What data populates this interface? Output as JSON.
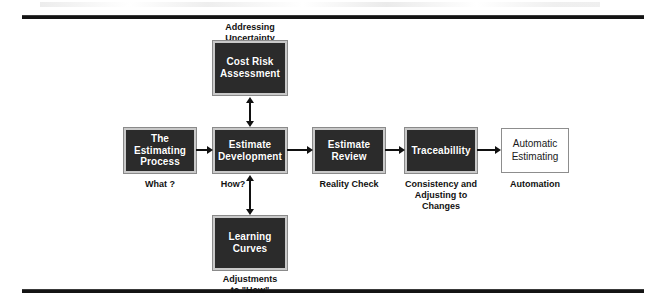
{
  "diagram": {
    "colors": {
      "node_fill_dark": "#2b2b2b",
      "node_border_light": "#c9c9c9",
      "node_fill_light": "#ffffff",
      "node_border_grey": "#8d8d8d",
      "text_on_dark": "#ffffff",
      "text_on_light": "#1a1a1a",
      "connector": "#111111",
      "rule": "#141414",
      "background": "#ffffff"
    },
    "nodes": [
      {
        "id": "estimating-process",
        "label": "The\nEstimating\nProcess",
        "style": "dark",
        "caption": "What ?"
      },
      {
        "id": "estimate-development",
        "label": "Estimate\nDevelopment",
        "style": "dark",
        "caption": "How?"
      },
      {
        "id": "estimate-review",
        "label": "Estimate\nReview",
        "style": "dark",
        "caption": "Reality Check"
      },
      {
        "id": "traceabillity",
        "label": "Traceabillity",
        "style": "dark",
        "caption": "Consistency and\nAdjusting to\nChanges"
      },
      {
        "id": "automatic-estimating",
        "label": "Automatic\nEstimating",
        "style": "light",
        "caption": "Automation"
      },
      {
        "id": "cost-risk-assessment",
        "label": "Cost Risk\nAssessment",
        "style": "dark",
        "caption": "Addressing\nUncertainty"
      },
      {
        "id": "learning-curves",
        "label": "Learning\nCurves",
        "style": "dark",
        "caption": "Adjustments\nto \"How\""
      }
    ],
    "connectors": [
      {
        "id": "process-to-development",
        "kind": "arrow-right"
      },
      {
        "id": "development-to-review",
        "kind": "arrow-right"
      },
      {
        "id": "review-to-traceabillity",
        "kind": "arrow-right"
      },
      {
        "id": "traceabillity-to-automatic",
        "kind": "arrow-right"
      },
      {
        "id": "cost-risk-to-development",
        "kind": "arrow-double-vertical"
      },
      {
        "id": "learning-curves-to-development",
        "kind": "arrow-double-vertical"
      }
    ]
  }
}
